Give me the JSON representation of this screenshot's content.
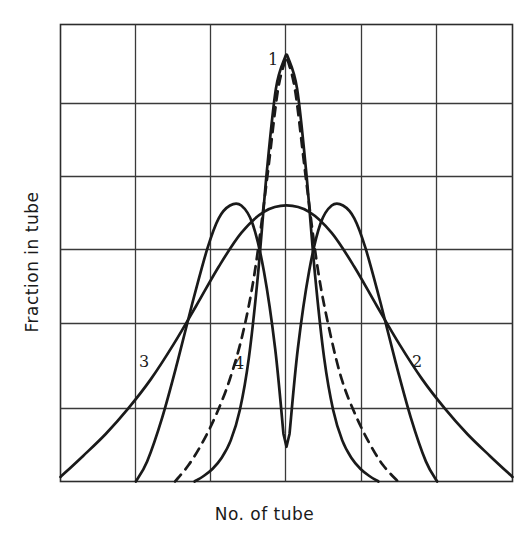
{
  "figure": {
    "title": "",
    "x_axis_label": "No. of tube",
    "y_axis_label": "Fraction in tube",
    "background_color": "#ffffff",
    "line_color": "#1a1a1a",
    "grid_color": "#3a3a3a"
  },
  "curve_labels": {
    "one": "1",
    "two": "2",
    "three": "3",
    "four": "4"
  },
  "chart_data": {
    "type": "line",
    "title": "",
    "xlabel": "No. of tube",
    "ylabel": "Fraction in tube",
    "xlim": [
      0,
      6
    ],
    "ylim": [
      0,
      5
    ],
    "grid": true,
    "grid_columns": 6,
    "grid_rows": 5,
    "x_tick_labels": [],
    "y_tick_labels": [],
    "legend_position": "inline-annotations",
    "annotations": [
      {
        "text": "1",
        "x": 2.95,
        "y": 4.72,
        "curve": "narrow-solid-peak"
      },
      {
        "text": "2",
        "x": 4.75,
        "y": 1.35,
        "curve": "broad-solid-right-tail"
      },
      {
        "text": "3",
        "x": 1.05,
        "y": 1.35,
        "curve": "broad-solid-left-tail"
      },
      {
        "text": "4",
        "x": 2.35,
        "y": 1.32,
        "curve": "dashed-peak"
      }
    ],
    "series": [
      {
        "name": "1",
        "style": "solid",
        "description": "Tall narrow symmetric peak, centred, maximum at full height",
        "x": [
          1.78,
          1.9,
          2.02,
          2.14,
          2.26,
          2.38,
          2.5,
          2.62,
          2.74,
          2.86,
          2.98,
          3.0,
          3.02,
          3.14,
          3.26,
          3.38,
          3.5,
          3.62,
          3.74,
          3.86,
          3.98,
          4.1,
          4.22
        ],
        "y": [
          0.0,
          0.06,
          0.14,
          0.26,
          0.45,
          0.78,
          1.35,
          2.25,
          3.4,
          4.3,
          4.64,
          4.65,
          4.64,
          4.3,
          3.4,
          2.25,
          1.35,
          0.78,
          0.45,
          0.26,
          0.14,
          0.06,
          0.0
        ]
      },
      {
        "name": "2 and 3",
        "style": "solid",
        "description": "Broad flat symmetric curve spanning the whole plot; left tail labelled 3, right tail labelled 2; meets the narrow peak near the centre",
        "x": [
          0.0,
          0.3,
          0.6,
          0.9,
          1.2,
          1.5,
          1.8,
          2.1,
          2.4,
          2.7,
          3.0,
          3.3,
          3.6,
          3.9,
          4.2,
          4.5,
          4.8,
          5.1,
          5.4,
          5.7,
          6.0
        ],
        "y": [
          0.05,
          0.28,
          0.52,
          0.8,
          1.12,
          1.5,
          1.92,
          2.35,
          2.72,
          2.95,
          3.02,
          2.95,
          2.72,
          2.35,
          1.92,
          1.5,
          1.12,
          0.8,
          0.52,
          0.28,
          0.05
        ]
      },
      {
        "name": "bimodal",
        "style": "solid",
        "description": "Twin-humped curve with a deep sharp V notch at the centre; humps at about x=2.3 and x=3.7",
        "x": [
          1.0,
          1.15,
          1.35,
          1.55,
          1.75,
          1.95,
          2.1,
          2.25,
          2.4,
          2.55,
          2.7,
          2.85,
          2.96,
          3.0,
          3.04,
          3.15,
          3.3,
          3.45,
          3.6,
          3.75,
          3.9,
          4.05,
          4.25,
          4.45,
          4.65,
          4.85,
          5.0
        ],
        "y": [
          0.0,
          0.22,
          0.7,
          1.3,
          1.95,
          2.55,
          2.88,
          3.02,
          3.02,
          2.82,
          2.3,
          1.45,
          0.52,
          0.38,
          0.52,
          1.45,
          2.3,
          2.82,
          3.02,
          3.02,
          2.88,
          2.55,
          1.95,
          1.3,
          0.7,
          0.22,
          0.0
        ]
      },
      {
        "name": "4",
        "style": "dashed",
        "description": "Dashed narrow peak, slightly narrower than curve 1, same apex height",
        "x": [
          1.52,
          1.7,
          1.88,
          2.06,
          2.24,
          2.42,
          2.58,
          2.74,
          2.88,
          2.98,
          3.0,
          3.02,
          3.12,
          3.26,
          3.42,
          3.58,
          3.74,
          3.92,
          4.1,
          4.28,
          4.48
        ],
        "y": [
          0.0,
          0.18,
          0.42,
          0.72,
          1.1,
          1.62,
          2.3,
          3.3,
          4.25,
          4.6,
          4.63,
          4.6,
          4.25,
          3.3,
          2.3,
          1.62,
          1.1,
          0.72,
          0.42,
          0.18,
          0.0
        ]
      }
    ]
  }
}
